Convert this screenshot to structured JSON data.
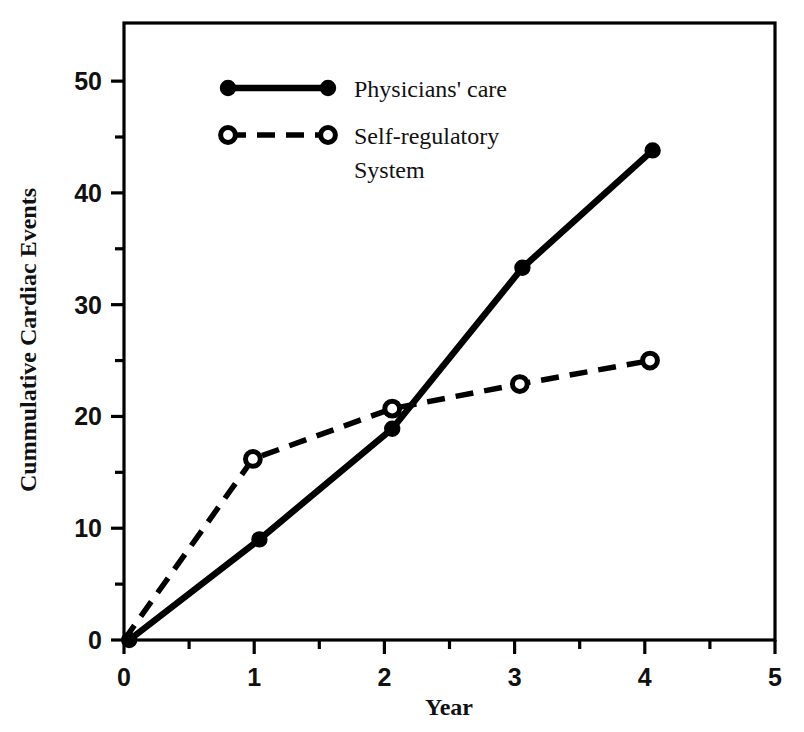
{
  "chart_data": {
    "type": "line",
    "title": "",
    "xlabel": "Year",
    "ylabel": "Cummulative Cardiac Events",
    "xlim": [
      0,
      5
    ],
    "ylim": [
      0,
      55.2
    ],
    "grid": false,
    "legend_position": "top-left inside plot",
    "x_ticks_major": [
      0,
      1,
      2,
      3,
      4,
      5
    ],
    "x_tick_labels": [
      "0",
      "1",
      "2",
      "3",
      "4",
      "5"
    ],
    "x_ticks_minor": [
      0.5,
      1.5,
      2.5,
      3.5,
      4.5
    ],
    "y_ticks_major": [
      0,
      10,
      20,
      30,
      40,
      50
    ],
    "y_tick_labels": [
      "0",
      "10",
      "20",
      "30",
      "40",
      "50"
    ],
    "y_ticks_minor": [
      5,
      15,
      25,
      35,
      45
    ],
    "x": [
      0,
      1,
      2,
      3,
      4
    ],
    "series": [
      {
        "name": "Physicians' care",
        "marker": "filled-circle",
        "line_style": "solid",
        "color": "#000000",
        "x": [
          0.04,
          1.04,
          2.06,
          3.06,
          4.06
        ],
        "values": [
          0,
          9.0,
          18.9,
          33.3,
          43.8
        ]
      },
      {
        "name": "Self-regulatory System",
        "marker": "open-circle",
        "line_style": "dashed",
        "color": "#000000",
        "x": [
          0.0,
          0.99,
          2.06,
          3.04,
          4.04
        ],
        "values": [
          0,
          16.2,
          20.7,
          22.9,
          25.0
        ]
      }
    ]
  },
  "legend": {
    "entries": [
      {
        "label_line1": "Physicians' care",
        "label_line2": ""
      },
      {
        "label_line1": "Self-regulatory",
        "label_line2": "System"
      }
    ]
  },
  "axes": {
    "x_title": "Year",
    "y_title": "Cummulative Cardiac Events"
  }
}
